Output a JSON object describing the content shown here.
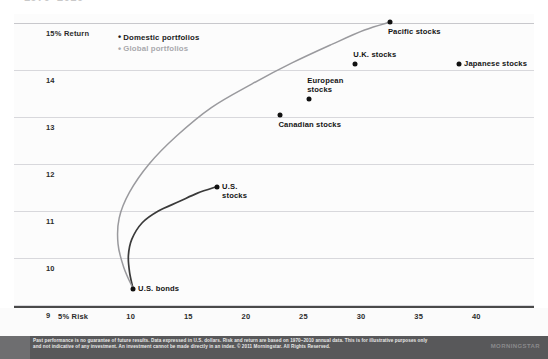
{
  "figure": {
    "title_ghost": "1970–2010",
    "footer": {
      "disclaimer": "Past performance is no guarantee of future results. Data expressed in U.S. dollars. Risk and return are based on 1970–2010 annual data. This is for illustrative purposes only and not indicative of any investment. An investment cannot be made directly in an index. © 2011 Morningstar. All Rights Reserved.",
      "logo": "MORNINGSTAR"
    },
    "colors": {
      "domestic": "#3a3a3a",
      "global": "#9a9a9e",
      "dot": "#111111",
      "grid": "#d8d8dc",
      "axis": "#4a4a4a",
      "footer_bg": "#58585a"
    }
  },
  "chart_data": {
    "type": "scatter",
    "title": "",
    "subtitle": "",
    "xlabel": "Risk",
    "ylabel": "Return",
    "xlim": [
      5,
      42
    ],
    "ylim": [
      9,
      15.3
    ],
    "grid": true,
    "legend_position": "top-left-inside",
    "x_ticks": [
      "5% Risk",
      "10",
      "15",
      "20",
      "25",
      "30",
      "35",
      "40"
    ],
    "x_tick_values": [
      5,
      10,
      15,
      20,
      25,
      30,
      35,
      40
    ],
    "y_ticks": [
      "15% Return",
      "14",
      "13",
      "12",
      "11",
      "10",
      "9"
    ],
    "y_tick_values": [
      15,
      14,
      13,
      12,
      11,
      10,
      9
    ],
    "legend": [
      {
        "name": "Domestic portfolios",
        "marker": "•",
        "color": "#1a1a1a"
      },
      {
        "name": "Global portfolios",
        "marker": "•",
        "color": "#a9a9ad"
      }
    ],
    "points": [
      {
        "label": "U.S. bonds",
        "x": 10.2,
        "y": 9.35,
        "label_pos": "right"
      },
      {
        "label": "U.S.\nstocks",
        "x": 17.5,
        "y": 11.52,
        "label_pos": "right"
      },
      {
        "label": "Canadian stocks",
        "x": 23.0,
        "y": 13.05,
        "label_pos": "below"
      },
      {
        "label": "European\nstocks",
        "x": 25.5,
        "y": 13.38,
        "label_pos": "above"
      },
      {
        "label": "U.K. stocks",
        "x": 29.5,
        "y": 14.12,
        "label_pos": "above"
      },
      {
        "label": "Pacific stocks",
        "x": 32.5,
        "y": 15.02,
        "label_pos": "below"
      },
      {
        "label": "Japanese stocks",
        "x": 38.5,
        "y": 14.12,
        "label_pos": "right"
      }
    ],
    "series": [
      {
        "name": "Domestic portfolios",
        "type": "efficient-frontier-curve",
        "color": "#3a3a3a",
        "x": [
          10.2,
          9.9,
          9.8,
          10.1,
          11.0,
          12.4,
          14.2,
          15.8,
          17.5
        ],
        "y": [
          9.35,
          9.7,
          10.05,
          10.4,
          10.75,
          11.0,
          11.2,
          11.38,
          11.52
        ]
      },
      {
        "name": "Global portfolios",
        "type": "efficient-frontier-curve",
        "color": "#9a9a9e",
        "x": [
          10.2,
          9.4,
          8.9,
          9.0,
          9.9,
          11.6,
          14.0,
          17.0,
          20.5,
          24.0,
          27.5,
          30.3,
          32.5
        ],
        "y": [
          9.35,
          9.8,
          10.3,
          10.85,
          11.4,
          12.0,
          12.6,
          13.2,
          13.7,
          14.15,
          14.55,
          14.85,
          15.02
        ]
      }
    ]
  }
}
